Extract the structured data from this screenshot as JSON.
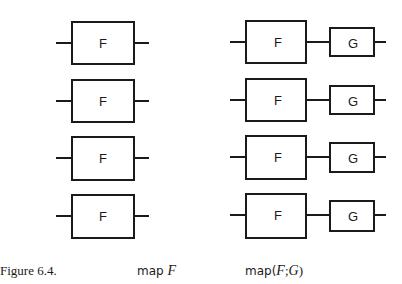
{
  "figure": {
    "caption_label": "Figure 6.4.",
    "left_caption": {
      "prefix": "map ",
      "arg": "F"
    },
    "right_caption": {
      "prefix": "map(",
      "arg1": "F",
      "sep": ";",
      "arg2": "G",
      "suffix": ")"
    }
  },
  "left_column": {
    "rows": [
      {
        "box_label": "F"
      },
      {
        "box_label": "F"
      },
      {
        "box_label": "F"
      },
      {
        "box_label": "F"
      }
    ]
  },
  "right_column": {
    "rows": [
      {
        "first_label": "F",
        "second_label": "G"
      },
      {
        "first_label": "F",
        "second_label": "G"
      },
      {
        "first_label": "F",
        "second_label": "G"
      },
      {
        "first_label": "F",
        "second_label": "G"
      }
    ]
  },
  "colors": {
    "ink": "#1a1a1a",
    "background": "#ffffff"
  }
}
